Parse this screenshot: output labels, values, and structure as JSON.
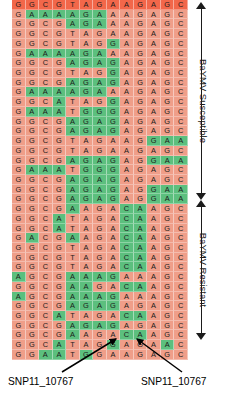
{
  "figure": {
    "type": "sequence-alignment-heatmap",
    "groups": [
      {
        "id": "susceptible",
        "label": "BaYMV Susceptible"
      },
      {
        "id": "resistant",
        "label": "BaYMV Resistant"
      }
    ],
    "annotations": [
      {
        "id": "snp-left",
        "label": "SNP11_10767"
      },
      {
        "id": "snp-right",
        "label": "SNP11_10767"
      }
    ],
    "colors": {
      "allele_major": "#ef9e89",
      "allele_minor": "#5cbf7e",
      "top_row_accent": "#f2674a",
      "text": "#1b1b1b",
      "arrow": "#000000",
      "background": "#ffffff"
    }
  },
  "chart_data": {
    "type": "heatmap",
    "title": "",
    "xlabel": "",
    "ylabel": "",
    "columns": 13,
    "rows": 35,
    "legend": [
      "BaYMV Susceptible",
      "BaYMV Resistant"
    ],
    "group_split_row": 21,
    "highlight_columns": [
      8,
      9
    ],
    "color_map": {
      "G": "varies",
      "A": "varies",
      "C": "varies",
      "T": "varies"
    },
    "note": "Cell color encodes allele state (red = reference/major, green = alternate/minor), not base identity.",
    "sequences": [
      {
        "bases": [
          "G",
          "G",
          "C",
          "G",
          "T",
          "A",
          "G",
          "A",
          "A",
          "G",
          "A",
          "G",
          "C"
        ],
        "states": [
          "R",
          "R",
          "R",
          "R",
          "R",
          "R",
          "R",
          "R",
          "R",
          "R",
          "R",
          "R",
          "R"
        ],
        "accent": true
      },
      {
        "bases": [
          "G",
          "A",
          "A",
          "A",
          "A",
          "G",
          "A",
          "A",
          "A",
          "G",
          "A",
          "G",
          "C"
        ],
        "states": [
          "R",
          "G",
          "G",
          "G",
          "G",
          "G",
          "G",
          "R",
          "R",
          "R",
          "R",
          "R",
          "R"
        ]
      },
      {
        "bases": [
          "G",
          "G",
          "C",
          "G",
          "A",
          "G",
          "A",
          "A",
          "A",
          "G",
          "A",
          "G",
          "C"
        ],
        "states": [
          "R",
          "R",
          "R",
          "R",
          "G",
          "G",
          "G",
          "R",
          "R",
          "R",
          "R",
          "R",
          "R"
        ]
      },
      {
        "bases": [
          "G",
          "G",
          "C",
          "G",
          "T",
          "A",
          "G",
          "A",
          "A",
          "G",
          "A",
          "G",
          "C"
        ],
        "states": [
          "R",
          "R",
          "R",
          "R",
          "R",
          "R",
          "R",
          "R",
          "R",
          "R",
          "R",
          "R",
          "R"
        ]
      },
      {
        "bases": [
          "G",
          "G",
          "C",
          "G",
          "T",
          "A",
          "G",
          "G",
          "A",
          "G",
          "A",
          "G",
          "C"
        ],
        "states": [
          "R",
          "R",
          "R",
          "R",
          "R",
          "R",
          "R",
          "G",
          "R",
          "R",
          "R",
          "R",
          "R"
        ]
      },
      {
        "bases": [
          "G",
          "A",
          "A",
          "A",
          "A",
          "G",
          "A",
          "A",
          "A",
          "G",
          "A",
          "G",
          "C"
        ],
        "states": [
          "R",
          "G",
          "G",
          "G",
          "G",
          "G",
          "G",
          "R",
          "R",
          "R",
          "R",
          "R",
          "R"
        ]
      },
      {
        "bases": [
          "G",
          "G",
          "C",
          "G",
          "A",
          "G",
          "A",
          "G",
          "A",
          "G",
          "A",
          "G",
          "C"
        ],
        "states": [
          "R",
          "R",
          "R",
          "R",
          "G",
          "G",
          "G",
          "G",
          "R",
          "R",
          "R",
          "R",
          "R"
        ]
      },
      {
        "bases": [
          "G",
          "G",
          "C",
          "G",
          "T",
          "A",
          "G",
          "G",
          "A",
          "G",
          "A",
          "G",
          "C"
        ],
        "states": [
          "R",
          "R",
          "R",
          "R",
          "R",
          "R",
          "R",
          "G",
          "R",
          "R",
          "R",
          "R",
          "R"
        ]
      },
      {
        "bases": [
          "G",
          "G",
          "C",
          "G",
          "A",
          "G",
          "A",
          "G",
          "A",
          "G",
          "A",
          "G",
          "C"
        ],
        "states": [
          "R",
          "R",
          "R",
          "R",
          "G",
          "G",
          "G",
          "G",
          "R",
          "R",
          "R",
          "R",
          "R"
        ]
      },
      {
        "bases": [
          "G",
          "A",
          "A",
          "A",
          "A",
          "G",
          "A",
          "A",
          "A",
          "G",
          "A",
          "G",
          "C"
        ],
        "states": [
          "R",
          "G",
          "G",
          "G",
          "G",
          "G",
          "G",
          "R",
          "R",
          "R",
          "R",
          "R",
          "R"
        ]
      },
      {
        "bases": [
          "G",
          "G",
          "C",
          "A",
          "T",
          "A",
          "G",
          "G",
          "A",
          "G",
          "A",
          "G",
          "C"
        ],
        "states": [
          "R",
          "R",
          "R",
          "G",
          "R",
          "R",
          "R",
          "G",
          "R",
          "R",
          "R",
          "R",
          "R"
        ]
      },
      {
        "bases": [
          "G",
          "A",
          "A",
          "A",
          "T",
          "G",
          "G",
          "G",
          "A",
          "G",
          "A",
          "G",
          "C"
        ],
        "states": [
          "R",
          "G",
          "G",
          "G",
          "R",
          "G",
          "G",
          "G",
          "R",
          "R",
          "R",
          "R",
          "R"
        ]
      },
      {
        "bases": [
          "G",
          "G",
          "C",
          "G",
          "A",
          "G",
          "A",
          "G",
          "A",
          "G",
          "A",
          "G",
          "C"
        ],
        "states": [
          "R",
          "R",
          "R",
          "R",
          "G",
          "G",
          "G",
          "G",
          "R",
          "R",
          "R",
          "R",
          "R"
        ]
      },
      {
        "bases": [
          "G",
          "G",
          "C",
          "G",
          "A",
          "G",
          "A",
          "G",
          "A",
          "G",
          "A",
          "G",
          "C"
        ],
        "states": [
          "R",
          "R",
          "R",
          "R",
          "G",
          "G",
          "G",
          "G",
          "R",
          "R",
          "R",
          "R",
          "R"
        ]
      },
      {
        "bases": [
          "G",
          "G",
          "C",
          "G",
          "T",
          "A",
          "G",
          "A",
          "A",
          "G",
          "G",
          "A",
          "A"
        ],
        "states": [
          "R",
          "R",
          "R",
          "R",
          "R",
          "R",
          "R",
          "R",
          "R",
          "R",
          "G",
          "G",
          "G"
        ]
      },
      {
        "bases": [
          "G",
          "G",
          "C",
          "G",
          "T",
          "A",
          "G",
          "A",
          "A",
          "G",
          "A",
          "G",
          "C"
        ],
        "states": [
          "R",
          "R",
          "R",
          "R",
          "R",
          "R",
          "R",
          "R",
          "R",
          "R",
          "R",
          "R",
          "R"
        ]
      },
      {
        "bases": [
          "G",
          "G",
          "C",
          "G",
          "A",
          "G",
          "A",
          "G",
          "A",
          "G",
          "G",
          "A",
          "A"
        ],
        "states": [
          "R",
          "R",
          "R",
          "R",
          "G",
          "G",
          "G",
          "G",
          "R",
          "R",
          "G",
          "G",
          "G"
        ]
      },
      {
        "bases": [
          "G",
          "A",
          "A",
          "A",
          "T",
          "G",
          "G",
          "G",
          "A",
          "G",
          "A",
          "G",
          "C"
        ],
        "states": [
          "R",
          "G",
          "G",
          "G",
          "R",
          "G",
          "G",
          "G",
          "R",
          "R",
          "R",
          "R",
          "R"
        ]
      },
      {
        "bases": [
          "G",
          "G",
          "C",
          "G",
          "A",
          "G",
          "A",
          "G",
          "A",
          "G",
          "A",
          "G",
          "C"
        ],
        "states": [
          "R",
          "R",
          "R",
          "R",
          "G",
          "G",
          "G",
          "G",
          "R",
          "R",
          "R",
          "R",
          "R"
        ]
      },
      {
        "bases": [
          "G",
          "G",
          "C",
          "G",
          "A",
          "G",
          "A",
          "G",
          "A",
          "G",
          "G",
          "A",
          "A"
        ],
        "states": [
          "R",
          "R",
          "R",
          "R",
          "G",
          "G",
          "G",
          "G",
          "R",
          "R",
          "G",
          "G",
          "G"
        ]
      },
      {
        "bases": [
          "G",
          "G",
          "C",
          "G",
          "A",
          "G",
          "A",
          "G",
          "A",
          "G",
          "G",
          "A",
          "A"
        ],
        "states": [
          "R",
          "R",
          "R",
          "R",
          "G",
          "G",
          "G",
          "G",
          "R",
          "R",
          "G",
          "G",
          "G"
        ]
      },
      {
        "bases": [
          "G",
          "G",
          "C",
          "G",
          "A",
          "A",
          "G",
          "A",
          "C",
          "A",
          "A",
          "G",
          "C"
        ],
        "states": [
          "R",
          "R",
          "R",
          "R",
          "G",
          "R",
          "R",
          "R",
          "G",
          "G",
          "R",
          "R",
          "R"
        ]
      },
      {
        "bases": [
          "G",
          "G",
          "C",
          "A",
          "T",
          "A",
          "G",
          "A",
          "C",
          "A",
          "A",
          "G",
          "C"
        ],
        "states": [
          "R",
          "R",
          "R",
          "G",
          "R",
          "R",
          "R",
          "R",
          "G",
          "G",
          "R",
          "R",
          "R"
        ]
      },
      {
        "bases": [
          "G",
          "G",
          "C",
          "A",
          "T",
          "A",
          "G",
          "A",
          "C",
          "A",
          "A",
          "G",
          "C"
        ],
        "states": [
          "R",
          "R",
          "R",
          "G",
          "R",
          "R",
          "R",
          "R",
          "G",
          "G",
          "R",
          "R",
          "R"
        ]
      },
      {
        "bases": [
          "G",
          "A",
          "C",
          "G",
          "A",
          "A",
          "G",
          "A",
          "C",
          "A",
          "A",
          "G",
          "C"
        ],
        "states": [
          "R",
          "G",
          "R",
          "R",
          "G",
          "R",
          "R",
          "R",
          "G",
          "G",
          "R",
          "R",
          "R"
        ]
      },
      {
        "bases": [
          "G",
          "G",
          "C",
          "G",
          "T",
          "A",
          "G",
          "A",
          "C",
          "A",
          "A",
          "G",
          "C"
        ],
        "states": [
          "R",
          "R",
          "R",
          "R",
          "R",
          "R",
          "R",
          "R",
          "G",
          "G",
          "R",
          "R",
          "R"
        ]
      },
      {
        "bases": [
          "G",
          "G",
          "C",
          "G",
          "T",
          "A",
          "G",
          "A",
          "C",
          "A",
          "A",
          "G",
          "C"
        ],
        "states": [
          "R",
          "R",
          "R",
          "R",
          "R",
          "R",
          "R",
          "R",
          "G",
          "G",
          "R",
          "R",
          "R"
        ]
      },
      {
        "bases": [
          "G",
          "G",
          "C",
          "G",
          "T",
          "A",
          "G",
          "A",
          "C",
          "A",
          "A",
          "G",
          "C"
        ],
        "states": [
          "R",
          "R",
          "R",
          "R",
          "R",
          "R",
          "R",
          "R",
          "G",
          "G",
          "R",
          "R",
          "R"
        ]
      },
      {
        "bases": [
          "A",
          "G",
          "C",
          "G",
          "A",
          "A",
          "A",
          "G",
          "A",
          "A",
          "A",
          "G",
          "C"
        ],
        "states": [
          "G",
          "R",
          "R",
          "R",
          "G",
          "G",
          "G",
          "G",
          "R",
          "R",
          "R",
          "R",
          "R"
        ]
      },
      {
        "bases": [
          "G",
          "G",
          "C",
          "G",
          "A",
          "A",
          "G",
          "A",
          "C",
          "A",
          "A",
          "G",
          "C"
        ],
        "states": [
          "R",
          "R",
          "R",
          "R",
          "G",
          "G",
          "R",
          "R",
          "G",
          "G",
          "R",
          "R",
          "R"
        ]
      },
      {
        "bases": [
          "A",
          "G",
          "C",
          "G",
          "A",
          "A",
          "A",
          "G",
          "A",
          "A",
          "A",
          "G",
          "C"
        ],
        "states": [
          "G",
          "R",
          "R",
          "R",
          "G",
          "G",
          "G",
          "G",
          "R",
          "R",
          "R",
          "R",
          "R"
        ]
      },
      {
        "bases": [
          "G",
          "G",
          "C",
          "G",
          "A",
          "G",
          "A",
          "G",
          "A",
          "G",
          "A",
          "G",
          "C"
        ],
        "states": [
          "R",
          "R",
          "R",
          "R",
          "G",
          "G",
          "G",
          "G",
          "R",
          "R",
          "R",
          "R",
          "R"
        ]
      },
      {
        "bases": [
          "G",
          "G",
          "C",
          "A",
          "T",
          "A",
          "G",
          "A",
          "C",
          "A",
          "A",
          "G",
          "C"
        ],
        "states": [
          "R",
          "R",
          "R",
          "G",
          "R",
          "R",
          "R",
          "R",
          "G",
          "G",
          "R",
          "R",
          "R"
        ]
      },
      {
        "bases": [
          "G",
          "G",
          "C",
          "G",
          "A",
          "G",
          "A",
          "G",
          "A",
          "G",
          "A",
          "G",
          "C"
        ],
        "states": [
          "R",
          "R",
          "R",
          "R",
          "G",
          "G",
          "G",
          "G",
          "R",
          "R",
          "R",
          "R",
          "R"
        ]
      },
      {
        "bases": [
          "G",
          "G",
          "C",
          "G",
          "A",
          "A",
          "G",
          "A",
          "C",
          "A",
          "A",
          "G",
          "C"
        ],
        "states": [
          "R",
          "R",
          "R",
          "R",
          "G",
          "R",
          "R",
          "R",
          "G",
          "G",
          "R",
          "R",
          "R"
        ]
      },
      {
        "bases": [
          "G",
          "G",
          "C",
          "A",
          "T",
          "A",
          "G",
          "G",
          "A",
          "G",
          "A",
          "A",
          "C"
        ],
        "states": [
          "R",
          "R",
          "R",
          "G",
          "R",
          "R",
          "R",
          "G",
          "R",
          "R",
          "R",
          "G",
          "R"
        ]
      },
      {
        "bases": [
          "G",
          "G",
          "A",
          "A",
          "T",
          "G",
          "G",
          "A",
          "A",
          "G",
          "A",
          "G",
          "C"
        ],
        "states": [
          "R",
          "R",
          "G",
          "G",
          "R",
          "G",
          "R",
          "R",
          "R",
          "R",
          "R",
          "R",
          "R"
        ]
      }
    ]
  }
}
